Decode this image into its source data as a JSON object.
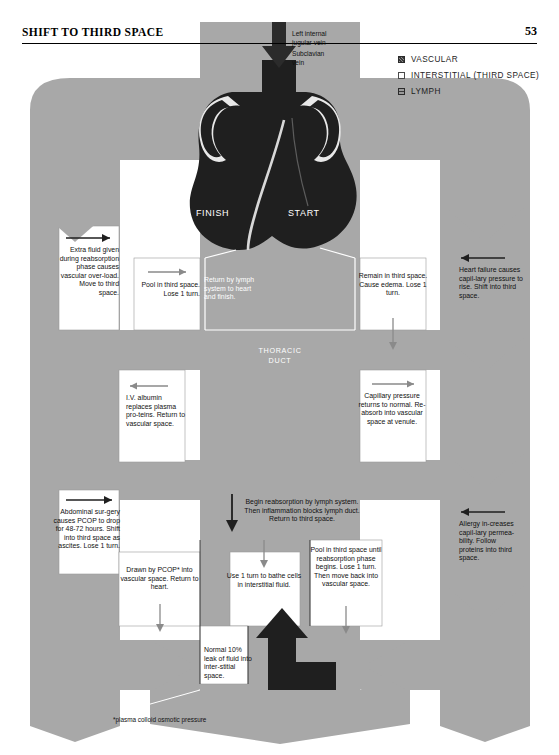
{
  "header": {
    "title": "SHIFT TO THIRD SPACE",
    "page_number": "53"
  },
  "legend": {
    "items": [
      {
        "label": "VASCULAR",
        "swatch": "vascular",
        "color": "#8c8c8c"
      },
      {
        "label": "INTERSTITIAL (THIRD SPACE)",
        "swatch": "interstitial",
        "color": "#ffffff"
      },
      {
        "label": "LYMPH",
        "swatch": "lymph",
        "color": "#9a9a9a"
      }
    ]
  },
  "anatomy": {
    "vein_label_line1": "Left internal",
    "vein_label_line2": "jugular vein",
    "vein_label_line3": "Subclavian",
    "vein_label_line4": "vein",
    "finish_label": "FINISH",
    "start_label": "START",
    "thoracic_duct_line1": "THORACIC",
    "thoracic_duct_line2": "DUCT"
  },
  "cells": {
    "extra_fluid": "Extra fluid given during reabsorption phase causes vascular over-load. Move to third space.",
    "pool_third_space": "Pool in third space. Lose 1 turn.",
    "return_lymph": "Return by lymph system to heart and finish.",
    "remain_third_space": "Remain in third space. Cause edema. Lose 1 turn.",
    "heart_failure": "Heart failure causes capil-lary pressure to rise. Shift into third space.",
    "iv_albumin": "I.V. albumin replaces plasma pro-teins. Return to vascular space.",
    "capillary_pressure": "Capillary pressure returns to normal. Re-absorb into vascular space at venule.",
    "abdominal_surgery": "Abdominal sur-gery causes PCOP to drop for 48-72 hours. Shift into third space as ascites. Lose 1 turn.",
    "begin_reabsorption": "Begin reabsorption by lymph system. Then inflammation blocks lymph duct. Return to third space.",
    "allergy": "Allergy in-creases capil-lary permea-bility. Follow proteins into third space.",
    "drawn_by_pcop": "Drawn by PCOP* into vascular space. Return to heart.",
    "use_one_turn": "Use 1 turn to bathe cells in interstitial fluid.",
    "pool_until_reabsorption": "Pool in third space until reabsorption phase begins. Lose 1 turn. Then move back into vascular space.",
    "normal_leak": "Normal 10% leak of fluid into inter-stitial space."
  },
  "footnote": "*plasma colloid osmotic pressure",
  "colors": {
    "board_gray": "#a8a8a8",
    "vessel_dark": "#2b2b2b",
    "cell_white": "#ffffff",
    "ink": "#111111"
  }
}
